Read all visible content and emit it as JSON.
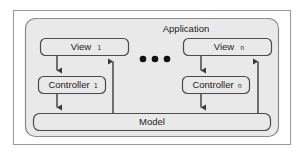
{
  "figure": {
    "title": "Application",
    "background_color": "#ffffff",
    "panel_color": "#e9e9e9",
    "border_color": "#8a8a8a",
    "outer_frame_color": "#9a9a9a",
    "line_color": "#3a3a3a",
    "text_color": "#1a1a1a"
  },
  "container": {
    "label": "Application"
  },
  "nodes": {
    "view_first": {
      "label": "View",
      "subscript": "1"
    },
    "view_last": {
      "label": "View",
      "subscript": "n"
    },
    "controller_first": {
      "label": "Controller",
      "subscript": "1"
    },
    "controller_last": {
      "label": "Controller",
      "subscript": "n"
    },
    "model": {
      "label": "Model",
      "subscript": ""
    }
  },
  "ellipsis": {
    "label": "• • •",
    "dot_count": 3,
    "meaning": "repeated view-controller pairs"
  },
  "edges": [
    {
      "id": "edge-view1-controller1",
      "from": "View",
      "to": "Controller",
      "direction": "down"
    },
    {
      "id": "edge-controller1-model",
      "from": "Controller",
      "to": "Model",
      "direction": "down"
    },
    {
      "id": "edge-model-view1",
      "from": "Model",
      "to": "View",
      "direction": "up"
    },
    {
      "id": "edge-viewn-controllern",
      "from": "View",
      "to": "Controller",
      "direction": "down"
    },
    {
      "id": "edge-controllern-model",
      "from": "Controller",
      "to": "Model",
      "direction": "down"
    },
    {
      "id": "edge-model-viewn",
      "from": "Model",
      "to": "View",
      "direction": "up"
    }
  ]
}
